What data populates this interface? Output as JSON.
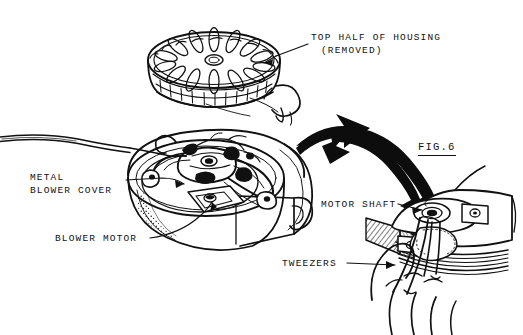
{
  "figure": {
    "number_label": "FIG.6",
    "style": "patent line drawing"
  },
  "callouts": {
    "top_half_of_housing": {
      "line1": "TOP HALF OF HOUSING",
      "line2": "(REMOVED)",
      "target": "exploded disc housing cover at top of figure"
    },
    "metal_blower_cover": {
      "line1": "METAL",
      "line2": "BLOWER COVER",
      "target": "metal cover inside main housing bowl"
    },
    "blower_motor": {
      "line1": "BLOWER MOTOR",
      "target": "motor mounted in center of main housing"
    },
    "motor_shaft": {
      "line1": "MOTOR SHAFT",
      "target": "shaft hub in enlarged detail view"
    },
    "tweezers": {
      "line1": "TWEEZERS",
      "target": "tweezers held by hand in detail view"
    }
  },
  "parts": {
    "top_housing_cover": "vented disc-shaped top half of housing",
    "housing_body": "lower housing shell containing blower",
    "power_cord": "cord exiting to left edge",
    "nozzle_spout": "small round outlet on housing cover",
    "detail_view": "enlarged view of motor shaft with hand and tweezers",
    "hand": "hand gripping tweezers",
    "pointer_arrow": "large curved arrow from main view to detail view"
  },
  "colors": {
    "ink": "#111111",
    "paper": "#ffffff",
    "arrow_fill": "#0d0d0d",
    "shade": "#444444"
  }
}
